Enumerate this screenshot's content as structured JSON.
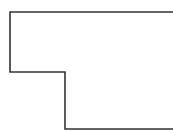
{
  "diagram": {
    "shape": "stepped-outline",
    "stroke_color": "#333333",
    "stroke_width": "1.6",
    "background": "#ffffff",
    "points": "173,12 10,12 10,72 65,72 65,129 173,129"
  }
}
